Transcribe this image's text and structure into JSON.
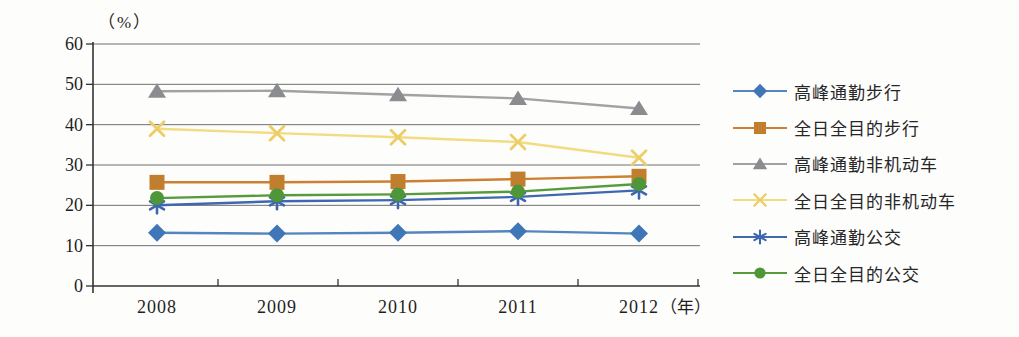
{
  "page": {
    "background": "#fdfdfc"
  },
  "chart_data": {
    "type": "line",
    "title": "",
    "y_unit_label": "（%）",
    "x_unit_label": "（年）",
    "categories": [
      "2008",
      "2009",
      "2010",
      "2011",
      "2012"
    ],
    "y_ticks": [
      0,
      10,
      20,
      30,
      40,
      50,
      60
    ],
    "ylim": [
      0,
      60
    ],
    "grid": true,
    "legend_position": "right",
    "axis_color": "#333333",
    "gridline_color": "#6f6f6f",
    "label_color": "#1f1f1f",
    "series": [
      {
        "name": "高峰通勤步行",
        "marker": "diamond",
        "color": "#3F76B8",
        "line_color": "#5585BE",
        "values": [
          13.2,
          13.0,
          13.2,
          13.6,
          13.0
        ]
      },
      {
        "name": "全日全目的步行",
        "marker": "square",
        "color": "#C17E2E",
        "line_color": "#CE8032",
        "values": [
          25.7,
          25.7,
          25.9,
          26.5,
          27.2
        ]
      },
      {
        "name": "高峰通勤非机动车",
        "marker": "triangle",
        "color": "#8A8C90",
        "line_color": "#A2A2A2",
        "values": [
          48.3,
          48.4,
          47.4,
          46.5,
          44.0
        ]
      },
      {
        "name": "全日全目的非机动车",
        "marker": "x",
        "color": "#EDCD66",
        "line_color": "#F2DC82",
        "values": [
          39.0,
          37.9,
          36.9,
          35.7,
          31.8
        ]
      },
      {
        "name": "高峰通勤公交",
        "marker": "asterisk",
        "color": "#3D66AE",
        "line_color": "#3E68B0",
        "values": [
          20.0,
          21.0,
          21.3,
          22.1,
          23.7
        ]
      },
      {
        "name": "全日全目的公交",
        "marker": "circle",
        "color": "#4F9639",
        "line_color": "#579B3E",
        "values": [
          21.8,
          22.5,
          22.7,
          23.4,
          25.3
        ]
      }
    ]
  }
}
